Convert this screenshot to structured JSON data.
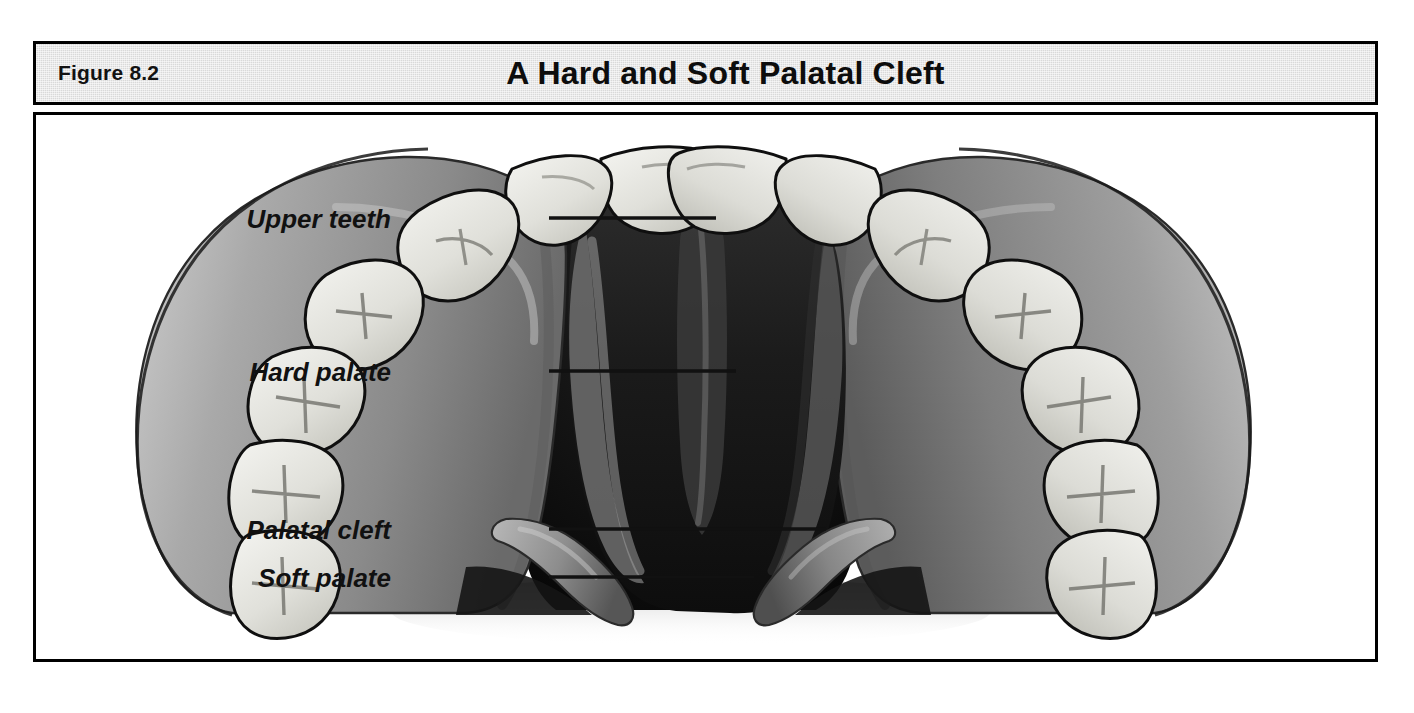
{
  "figure": {
    "number_label": "Figure 8.2",
    "title": "A Hard and Soft Palatal Cleft"
  },
  "illustration": {
    "name": "maxillary-arch-with-palatal-cleft",
    "description": "Inferior view of the maxilla showing a cleft extending through the hard and soft palate, flanked by the upper dental arch",
    "labels": [
      {
        "id": "upper-teeth",
        "text": "Upper teeth"
      },
      {
        "id": "hard-palate",
        "text": "Hard palate"
      },
      {
        "id": "palatal-cleft",
        "text": "Palatal cleft"
      },
      {
        "id": "soft-palate",
        "text": "Soft palate"
      }
    ]
  },
  "colors": {
    "header_background": "#d9d9d9",
    "frame_border": "#000000",
    "page_background": "#ffffff",
    "palate_midtone": "#8a8a8a",
    "palate_highlight": "#b4b4b4",
    "palate_shadow": "#5e5e5e",
    "cleft_dark": "#1a1a1a",
    "tooth_fill": "#e2e2de",
    "tooth_outline": "#111111",
    "label_text": "#111111",
    "leader_line": "#111111"
  }
}
